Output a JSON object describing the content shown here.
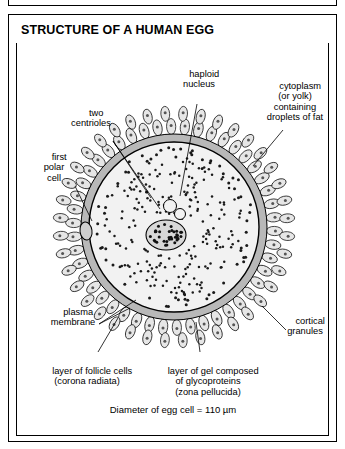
{
  "figure": {
    "title": "STRUCTURE OF A HUMAN EGG",
    "caption": "Diameter of egg cell = 110 µm"
  },
  "labels": {
    "haploid_nucleus": "haploid\nnucleus",
    "cytoplasm": "cytoplasm\n(or yolk)\ncontaining\ndroplets of fat",
    "two_centrioles": "two\ncentrioles",
    "first_polar_cell": "first\npolar\ncell",
    "plasma_membrane": "plasma\nmembrane",
    "cortical_granules": "cortical\ngranules",
    "follicle_cells": "layer of follicle cells\n(corona radiata)",
    "zona_pellucida": "layer of gel composed\nof glycoproteins\n(zona pellucida)"
  },
  "colors": {
    "outline": "#000000",
    "cytoplasm_fill": "#f2f2f2",
    "zona_fill": "#b8b8b8",
    "follicle_fill": "#e6e6e6",
    "nucleus_fill": "#d0d0d0",
    "granule": "#1a1a1a",
    "page_background": "#ffffff"
  }
}
